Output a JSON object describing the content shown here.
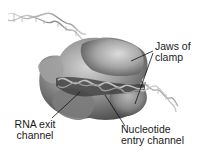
{
  "diagram": {
    "labels": {
      "jaws": {
        "line1": "Jaws of",
        "line2": "clamp"
      },
      "rna_exit": {
        "line1": "RNA exit",
        "line2": "channel"
      },
      "nucleotide_entry": {
        "line1": "Nucleotide",
        "line2": "entry channel"
      }
    },
    "colors": {
      "background": "#ffffff",
      "protein_light": "#c8c8c8",
      "protein_mid": "#8a8a8a",
      "protein_dark": "#3c3c3c",
      "dna": "#9a9a9a",
      "text": "#1a1a1a",
      "leader_line": "#111111"
    }
  }
}
